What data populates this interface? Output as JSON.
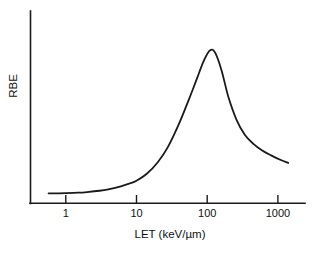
{
  "chart_data": {
    "type": "line",
    "title": "",
    "xlabel": "LET (keV/µm)",
    "ylabel": "RBE",
    "xscale": "log",
    "yscale": "linear",
    "grid": false,
    "legend": null,
    "xlim": [
      0.45,
      2000
    ],
    "ylim": [
      0,
      1.12
    ],
    "xticks": [
      1,
      10,
      100,
      1000
    ],
    "xticklabels": [
      "1",
      "10",
      "100",
      "1000"
    ],
    "yticks": [],
    "yticklabels": [],
    "series": [
      {
        "name": "RBE",
        "x": [
          0.57,
          0.8,
          1.0,
          1.5,
          2.0,
          3.0,
          4.0,
          6.0,
          8.0,
          10.0,
          14.0,
          20.0,
          28.0,
          40.0,
          55.0,
          70.0,
          90.0,
          110.0,
          130.0,
          160.0,
          200.0,
          260.0,
          340.0,
          450.0,
          600.0,
          800.0,
          1100.0,
          1400.0
        ],
        "y": [
          0.061,
          0.061,
          0.062,
          0.065,
          0.069,
          0.077,
          0.086,
          0.104,
          0.122,
          0.139,
          0.182,
          0.253,
          0.35,
          0.492,
          0.641,
          0.76,
          0.884,
          0.947,
          0.93,
          0.82,
          0.655,
          0.516,
          0.424,
          0.367,
          0.326,
          0.296,
          0.267,
          0.249
        ]
      }
    ],
    "annotations": []
  },
  "axes": {
    "x_axis_label": "LET (keV/µm)",
    "y_axis_label": "RBE",
    "x_tick_labels": [
      "1",
      "10",
      "100",
      "1000"
    ]
  },
  "colors": {
    "background": "#ffffff",
    "axis": "#1a1a1a",
    "curve": "#1a1a1a",
    "text": "#111111"
  }
}
